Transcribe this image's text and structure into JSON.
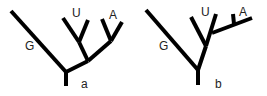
{
  "trees": [
    {
      "caption": "a",
      "labels": {
        "G": "G",
        "U": "U",
        "A": "A"
      }
    },
    {
      "caption": "b",
      "labels": {
        "G": "G",
        "U": "U",
        "A": "A"
      }
    }
  ],
  "line_color": "#000000"
}
